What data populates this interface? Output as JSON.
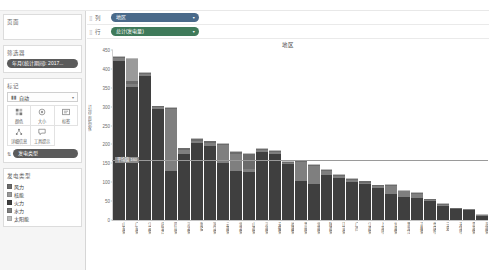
{
  "app": {
    "name": "Tableau Desktop"
  },
  "shelves": {
    "columns": {
      "label": "列",
      "field": "地区",
      "grip": "⣿",
      "caret": "▾"
    },
    "rows": {
      "label": "行",
      "field": "总计(发电量)",
      "grip": "⣿",
      "caret": "▾"
    }
  },
  "sidebar": {
    "pages": {
      "title": "页面"
    },
    "filters": {
      "title": "筛选器",
      "items": [
        {
          "label": "年月(统计期间): 2017..."
        }
      ]
    },
    "marks": {
      "title": "标记",
      "type_label": "自动",
      "type_icon": "bar-chart-icon",
      "caret": "▾",
      "buttons": [
        {
          "name": "color",
          "label": "颜色",
          "icon": "color-icon"
        },
        {
          "name": "size",
          "label": "大小",
          "icon": "size-icon"
        },
        {
          "name": "label",
          "label": "标签",
          "icon": "label-icon"
        },
        {
          "name": "detail",
          "label": "详细信息",
          "icon": "detail-icon"
        },
        {
          "name": "tooltip",
          "label": "工具提示",
          "icon": "tooltip-icon"
        }
      ],
      "encoding_pill": {
        "icon": "size-sort-icon",
        "label": "发电类型"
      }
    },
    "legend": {
      "title": "发电类型",
      "items": [
        {
          "label": "风力",
          "color": "#6b6b6b"
        },
        {
          "label": "核能",
          "color": "#9a9a9a"
        },
        {
          "label": "火力",
          "color": "#3f3f3f"
        },
        {
          "label": "水力",
          "color": "#7f7f7f"
        },
        {
          "label": "太阳能",
          "color": "#bdbdbd"
        }
      ]
    }
  },
  "chart_data": {
    "type": "bar",
    "stacked": true,
    "title": "地区",
    "xlabel": "",
    "ylabel": "发电量 总计",
    "ylim": [
      0,
      450
    ],
    "yticks": [
      0,
      50,
      100,
      150,
      200,
      250,
      300,
      350,
      400,
      450
    ],
    "grid": false,
    "legend_position": "left",
    "reference_line": {
      "value": 160,
      "label": "平均值 160"
    },
    "series": [
      {
        "name": "火力",
        "color": "#3f3f3f",
        "values": [
          420,
          352,
          382,
          293,
          130,
          175,
          205,
          196,
          150,
          131,
          128,
          180,
          176,
          148,
          104,
          96,
          118,
          112,
          101,
          96,
          86,
          70,
          62,
          58,
          50,
          37,
          28,
          26,
          11
        ]
      },
      {
        "name": "水力",
        "color": "#7f7f7f",
        "values": [
          8,
          9,
          4,
          5,
          163,
          11,
          5,
          9,
          48,
          45,
          7,
          6,
          4,
          3,
          50,
          47,
          12,
          5,
          4,
          3,
          3,
          20,
          14,
          12,
          3,
          3,
          2,
          2,
          2
        ]
      },
      {
        "name": "风力",
        "color": "#6b6b6b",
        "values": [
          4,
          6,
          3,
          3,
          3,
          4,
          4,
          3,
          3,
          4,
          40,
          3,
          3,
          3,
          3,
          3,
          3,
          3,
          3,
          3,
          3,
          3,
          2,
          2,
          2,
          2,
          1,
          1,
          1
        ]
      },
      {
        "name": "核能",
        "color": "#9a9a9a",
        "values": [
          0,
          60,
          0,
          0,
          0,
          0,
          0,
          0,
          0,
          0,
          0,
          0,
          0,
          0,
          0,
          0,
          0,
          0,
          0,
          0,
          0,
          0,
          0,
          0,
          0,
          0,
          0,
          0,
          0
        ]
      },
      {
        "name": "太阳能",
        "color": "#bdbdbd",
        "values": [
          3,
          3,
          2,
          2,
          2,
          2,
          2,
          2,
          2,
          2,
          2,
          2,
          2,
          2,
          2,
          2,
          2,
          2,
          2,
          2,
          2,
          2,
          2,
          2,
          2,
          2,
          1,
          1,
          1
        ]
      }
    ],
    "categories": [
      "山东省",
      "广东省",
      "江苏省",
      "内蒙古",
      "四川省",
      "河北省",
      "新疆",
      "浙江省",
      "云南省",
      "湖北省",
      "山西省",
      "河南省",
      "安徽省",
      "福建省",
      "贵州省",
      "湖南省",
      "陕西省",
      "辽宁省",
      "广西",
      "江西省",
      "上海市",
      "甘肃省",
      "黑龙江",
      "吉林省",
      "重庆市",
      "宁夏",
      "天津市",
      "青海省",
      "海南省"
    ]
  }
}
